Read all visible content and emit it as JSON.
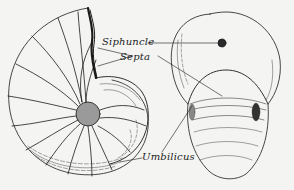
{
  "figure": {
    "labels": {
      "siphuncle": "Siphuncle",
      "septa": "Septa",
      "umbilicus": "Umbilicus"
    },
    "colors": {
      "background": "#f4f4f2",
      "ink": "#1a1a1a"
    }
  }
}
